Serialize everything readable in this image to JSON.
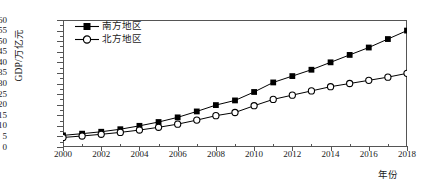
{
  "chart_data": {
    "type": "line",
    "title": "",
    "xlabel": "年份",
    "ylabel": "GDP/万亿元",
    "x": [
      2000,
      2001,
      2002,
      2003,
      2004,
      2005,
      2006,
      2007,
      2008,
      2009,
      2010,
      2011,
      2012,
      2013,
      2014,
      2015,
      2016,
      2017,
      2018
    ],
    "xlim": [
      2000,
      2018
    ],
    "ylim": [
      0,
      60
    ],
    "yticks": [
      0,
      5,
      10,
      15,
      20,
      25,
      30,
      35,
      40,
      45,
      50,
      55,
      60
    ],
    "xticks_major": [
      2000,
      2002,
      2004,
      2006,
      2008,
      2010,
      2012,
      2014,
      2016,
      2018
    ],
    "xticks_minor": [
      2001,
      2003,
      2005,
      2007,
      2009,
      2011,
      2013,
      2015,
      2017
    ],
    "grid": false,
    "legend_position": "top-left",
    "series": [
      {
        "name": "南方地区",
        "marker": "filled-square",
        "color": "#000000",
        "values": [
          5.5,
          6.3,
          7.2,
          8.4,
          10.0,
          11.8,
          14.0,
          16.8,
          19.8,
          22.0,
          26.0,
          30.5,
          33.5,
          36.5,
          40.0,
          43.5,
          47.0,
          51.0,
          55.0
        ]
      },
      {
        "name": "北方地区",
        "marker": "open-circle",
        "color": "#000000",
        "values": [
          4.5,
          5.2,
          6.0,
          6.9,
          8.0,
          9.3,
          10.8,
          12.7,
          14.8,
          16.3,
          19.5,
          22.5,
          24.5,
          26.5,
          28.5,
          30.0,
          31.5,
          33.0,
          34.8
        ]
      }
    ]
  },
  "axis": {
    "ytick_labels": [
      "60",
      "55",
      "50",
      "45",
      "40",
      "35",
      "30",
      "25",
      "20",
      "15",
      "10",
      "5",
      "0"
    ],
    "xtick_labels": [
      "2000",
      "2002",
      "2004",
      "2006",
      "2008",
      "2010",
      "2012",
      "2014",
      "2016",
      "2018"
    ]
  },
  "legend": {
    "items": [
      {
        "label": "南方地区",
        "marker": "filled-square"
      },
      {
        "label": "北方地区",
        "marker": "open-circle"
      }
    ]
  }
}
